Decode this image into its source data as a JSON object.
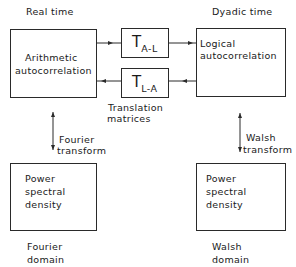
{
  "diagram": {
    "headers": {
      "left": "Real time",
      "right": "Dyadic time"
    },
    "boxes": {
      "arithmetic": {
        "line1": "Arithmetic",
        "line2": "autocorrelation"
      },
      "logical": {
        "line1": "Logical",
        "line2": "autocorrelation"
      },
      "t_al": {
        "main": "T",
        "sub": "A-L"
      },
      "t_la": {
        "main": "T",
        "sub": "L-A"
      },
      "psd_fourier": {
        "line1": "Power",
        "line2": "spectral",
        "line3": "density"
      },
      "psd_walsh": {
        "line1": "Power",
        "line2": "spectral",
        "line3": "density"
      }
    },
    "translation_label": {
      "line1": "Translation",
      "line2": "matrices"
    },
    "transforms": {
      "fourier": {
        "line1": "Fourier",
        "line2": "transform"
      },
      "walsh": {
        "line1": "Walsh",
        "line2": "transform"
      }
    },
    "domains": {
      "fourier": {
        "line1": "Fourier",
        "line2": "domain"
      },
      "walsh": {
        "line1": "Walsh",
        "line2": "domain"
      }
    },
    "colors": {
      "line": "#2a2a2a",
      "text": "#1a1a1a",
      "background": "#ffffff"
    }
  }
}
